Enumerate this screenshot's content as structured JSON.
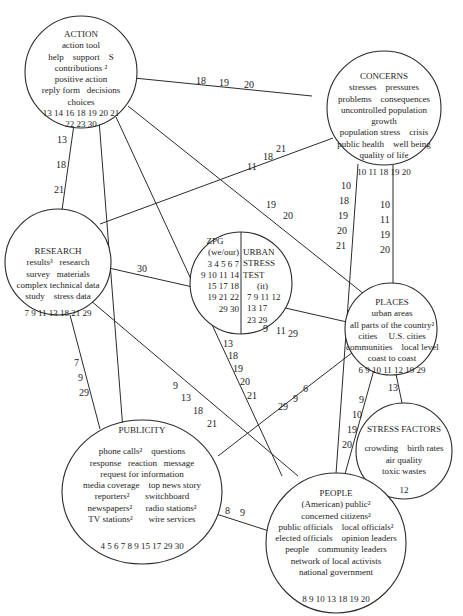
{
  "nodes": {
    "action": {
      "title": "ACTION",
      "lines": [
        "action tool",
        "help    support    S",
        "contributions ²",
        "positive action",
        "reply form   decisions",
        "choices"
      ],
      "codes": [
        "13 14 16 18 19 20 21",
        "22 23 30"
      ]
    },
    "concerns": {
      "title": "CONCERNS",
      "lines": [
        "stresses    pressures",
        "problems    consequences",
        "uncontrolled population",
        "growth",
        "population stress    crisis",
        "public health    well being",
        "quality of life"
      ],
      "codes": [
        "10 11 18 19 20"
      ]
    },
    "research": {
      "title": "RESEARCH",
      "lines": [
        "results³   research",
        "survey   materials",
        "complex technical data",
        "study    stress data"
      ],
      "codes": [
        "7 9 11 13 18 21 29"
      ]
    },
    "zpg": {
      "title": "ZPG",
      "lines": [
        "(we/our)",
        "3 4 5 6 7",
        "9 10 11 14",
        "15 17 18",
        "19 21 22",
        "29 30"
      ]
    },
    "urban_stress_test": {
      "title": "URBAN",
      "lines": [
        "STRESS",
        "TEST",
        "(it)",
        "7 9 11 12",
        "13 17",
        "23 29"
      ]
    },
    "places": {
      "title": "PLACES",
      "lines": [
        "urban areas",
        "all parts of the country²",
        "cities     U.S. cities",
        "communities    local level",
        "coast to coast"
      ],
      "codes": [
        "6 9 10 11 12 19 29"
      ]
    },
    "stress_factors": {
      "title": "STRESS FACTORS",
      "lines": [
        "crowding    birth rates",
        "air quality",
        "toxic wastes"
      ],
      "codes": [
        "12"
      ]
    },
    "publicity": {
      "title": "PUBLICITY",
      "lines": [
        "phone calls²    questions",
        "response   reaction   message",
        "request for information",
        "media coverage    top news story",
        "reporters²       switchboard",
        "newspapers²      radio stations²",
        "TV stations²       wire services"
      ],
      "codes": [
        "4 5 6 7 8 9 15 17 29 30"
      ]
    },
    "people": {
      "title": "PEOPLE",
      "lines": [
        "(American) public²",
        "concerned citizens²",
        "public officials    local officials²",
        "elected officials    opinion leaders",
        "people    community leaders",
        "network of local activists",
        "national government"
      ],
      "codes": [
        "8 9 10 13 18 19 20"
      ]
    }
  },
  "edges": [
    {
      "from": "action",
      "to": "concerns",
      "labels": [
        "18",
        "19",
        "20"
      ]
    },
    {
      "from": "action",
      "to": "research",
      "labels": [
        "13",
        "18",
        "21"
      ]
    },
    {
      "from": "action",
      "to": "publicity",
      "labels": [
        "30"
      ]
    },
    {
      "from": "action",
      "to": "people",
      "labels": [
        "13",
        "18",
        "19",
        "20",
        "21"
      ]
    },
    {
      "from": "action",
      "to": "places",
      "labels": [
        "19",
        "20"
      ]
    },
    {
      "from": "concerns",
      "to": "research",
      "labels": [
        "11",
        "18",
        "21"
      ]
    },
    {
      "from": "concerns",
      "to": "people",
      "labels": [
        "10",
        "18",
        "19",
        "20",
        "21"
      ]
    },
    {
      "from": "concerns",
      "to": "places",
      "labels": [
        "10",
        "11",
        "19",
        "20"
      ]
    },
    {
      "from": "research",
      "to": "places",
      "labels": [
        "9",
        "11",
        "29"
      ]
    },
    {
      "from": "research",
      "to": "publicity",
      "labels": [
        "7",
        "9",
        "29"
      ]
    },
    {
      "from": "research",
      "to": "people",
      "labels": [
        "9",
        "13",
        "18",
        "21"
      ]
    },
    {
      "from": "places",
      "to": "publicity",
      "labels": [
        "29",
        "9",
        "6"
      ]
    },
    {
      "from": "places",
      "to": "people",
      "labels": [
        "9",
        "10",
        "19",
        "20"
      ]
    },
    {
      "from": "places",
      "to": "stress_factors",
      "labels": [
        "13"
      ]
    },
    {
      "from": "publicity",
      "to": "people",
      "labels": [
        "8",
        "9"
      ]
    }
  ],
  "edge_labels": {
    "action_concerns": {
      "a": "18",
      "b": "19",
      "c": "20"
    },
    "action_research": {
      "a": "13",
      "b": "18",
      "c": "21"
    },
    "action_publicity": {
      "a": "30"
    },
    "action_people": {
      "a": "13",
      "b": "18",
      "c": "19",
      "d": "20",
      "e": "21"
    },
    "action_places": {
      "a": "19",
      "b": "20"
    },
    "concerns_research": {
      "a": "11",
      "b": "18",
      "c": "21"
    },
    "concerns_people": {
      "a": "10",
      "b": "18",
      "c": "19",
      "d": "20",
      "e": "21"
    },
    "concerns_places": {
      "a": "10",
      "b": "11",
      "c": "19",
      "d": "20"
    },
    "research_places": {
      "a": "9",
      "b": "11",
      "c": "29"
    },
    "research_publicity": {
      "a": "7",
      "b": "9",
      "c": "29"
    },
    "research_people": {
      "a": "9",
      "b": "13",
      "c": "18",
      "d": "21"
    },
    "places_publicity": {
      "a": "29",
      "b": "9",
      "c": "6"
    },
    "places_people": {
      "a": "9",
      "b": "10",
      "c": "19",
      "d": "20"
    },
    "places_stress_factors": {
      "a": "13"
    },
    "publicity_people": {
      "a": "8",
      "b": "9"
    }
  }
}
